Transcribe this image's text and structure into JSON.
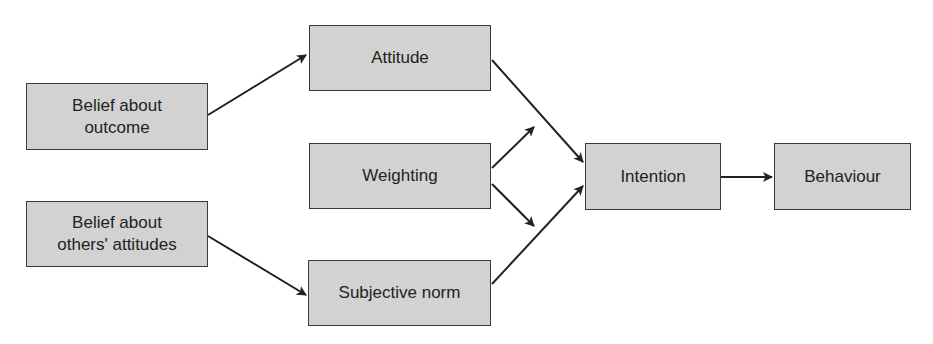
{
  "diagram": {
    "type": "flowchart",
    "background": "#ffffff",
    "box_fill": "#d2d2d2",
    "box_border": "#3a3a3a",
    "arrow_color": "#222222",
    "nodes": {
      "belief_outcome": {
        "label": "Belief about\noutcome"
      },
      "belief_others": {
        "label": "Belief about\nothers' attitudes"
      },
      "attitude": {
        "label": "Attitude"
      },
      "weighting": {
        "label": "Weighting"
      },
      "subjective_norm": {
        "label": "Subjective norm"
      },
      "intention": {
        "label": "Intention"
      },
      "behaviour": {
        "label": "Behaviour"
      }
    },
    "edges": [
      {
        "from": "Belief about outcome",
        "to": "Attitude"
      },
      {
        "from": "Belief about others' attitudes",
        "to": "Subjective norm"
      },
      {
        "from": "Attitude",
        "to": "Intention"
      },
      {
        "from": "Subjective norm",
        "to": "Intention"
      },
      {
        "from": "Weighting",
        "to": "Attitude→Intention link"
      },
      {
        "from": "Weighting",
        "to": "Subjective norm→Intention link"
      },
      {
        "from": "Intention",
        "to": "Behaviour"
      }
    ]
  }
}
